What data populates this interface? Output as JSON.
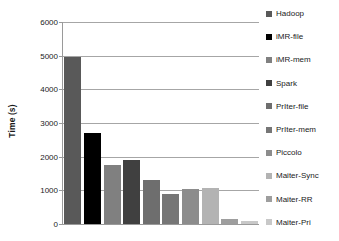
{
  "chart_data": {
    "type": "bar",
    "title": "",
    "xlabel": "",
    "ylabel": "Time (s)",
    "ylim": [
      0,
      6000
    ],
    "ytick_labels": [
      "6000",
      "5000",
      "4000",
      "3000",
      "2000",
      "1000",
      "0"
    ],
    "ytick_values": [
      6000,
      5000,
      4000,
      3000,
      2000,
      1000,
      0
    ],
    "grid": "horizontal",
    "legend_position": "right",
    "categories": [
      "Hadoop",
      "iMR-file",
      "iMR-mem",
      "Spark",
      "PrIter-file",
      "PrIter-mem",
      "Piccolo",
      "Maiter-Sync",
      "Maiter-RR",
      "Maiter-Pri"
    ],
    "values": [
      4950,
      2700,
      1750,
      1890,
      1320,
      880,
      1040,
      1060,
      150,
      100
    ],
    "colors": [
      "#595959",
      "#000000",
      "#808080",
      "#404040",
      "#6e6e6e",
      "#767676",
      "#8c8c8c",
      "#b3b3b3",
      "#9e9e9e",
      "#c8c8c8"
    ]
  },
  "legend": {
    "items": [
      {
        "label": "Hadoop",
        "color": "#595959"
      },
      {
        "label": "iMR-file",
        "color": "#000000"
      },
      {
        "label": "iMR-mem",
        "color": "#808080"
      },
      {
        "label": "Spark",
        "color": "#404040"
      },
      {
        "label": "PrIter-file",
        "color": "#6e6e6e"
      },
      {
        "label": "PrIter-mem",
        "color": "#767676"
      },
      {
        "label": "Piccolo",
        "color": "#8c8c8c"
      },
      {
        "label": "Maiter-Sync",
        "color": "#b3b3b3"
      },
      {
        "label": "Maiter-RR",
        "color": "#9e9e9e"
      },
      {
        "label": "Maiter-Pri",
        "color": "#c8c8c8"
      }
    ]
  }
}
